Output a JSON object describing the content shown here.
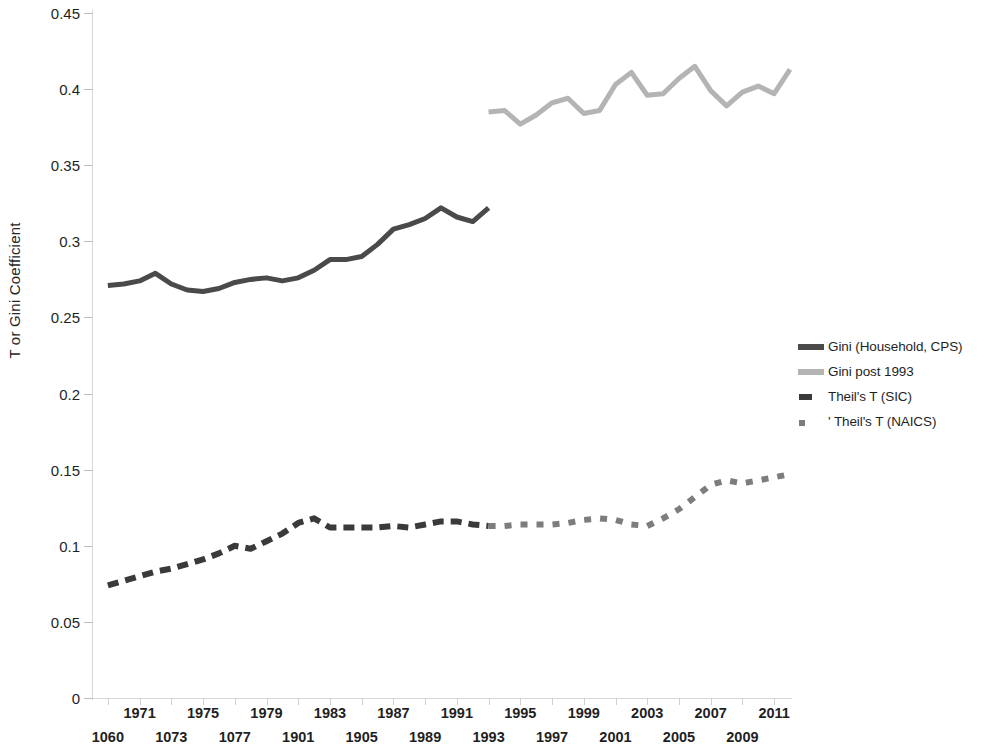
{
  "chart_data": {
    "type": "line",
    "title": "",
    "xlabel": "",
    "ylabel": "T or Gini Coefficient",
    "ylim": [
      0,
      0.45
    ],
    "ytick_labels": [
      "0.45",
      "0.4",
      "0.35",
      "0.3",
      "0.25",
      "0.2",
      "0.15",
      "0.1",
      "0.05",
      "0"
    ],
    "ytick_values": [
      0.45,
      0.4,
      0.35,
      0.3,
      0.25,
      0.2,
      0.15,
      0.1,
      0.05,
      0
    ],
    "xlim": [
      1968,
      2012
    ],
    "grid": false,
    "legend_position": "right",
    "xtick_labels_top": [
      "1971",
      "1975",
      "1979",
      "1983",
      "1987",
      "1991",
      "1995",
      "1999",
      "2003",
      "2007",
      "2011"
    ],
    "xtick_labels_bottom": [
      "1060",
      "1073",
      "1077",
      "1901",
      "1905",
      "1989",
      "1993",
      "1997",
      "2001",
      "2005",
      "2009"
    ],
    "xtick_values_top": [
      1971,
      1975,
      1979,
      1983,
      1987,
      1991,
      1995,
      1999,
      2003,
      2007,
      2011
    ],
    "xtick_values_bottom": [
      1969,
      1973,
      1977,
      1981,
      1985,
      1989,
      1993,
      1997,
      2001,
      2005,
      2009
    ],
    "series": [
      {
        "name": "Gini (Household, CPS)",
        "color": "#4a4a4a",
        "style": "solid",
        "width": 5,
        "x": [
          1969,
          1970,
          1971,
          1972,
          1973,
          1974,
          1975,
          1976,
          1977,
          1978,
          1979,
          1980,
          1981,
          1982,
          1983,
          1984,
          1985,
          1986,
          1987,
          1988,
          1989,
          1990,
          1991,
          1992,
          1993
        ],
        "values": [
          0.271,
          0.272,
          0.274,
          0.279,
          0.272,
          0.268,
          0.267,
          0.269,
          0.273,
          0.275,
          0.276,
          0.274,
          0.276,
          0.281,
          0.288,
          0.288,
          0.29,
          0.298,
          0.308,
          0.311,
          0.315,
          0.322,
          0.316,
          0.313,
          0.322
        ]
      },
      {
        "name": "Gini post 1993",
        "color": "#b4b4b4",
        "style": "solid",
        "width": 5,
        "x": [
          1993,
          1994,
          1995,
          1996,
          1997,
          1998,
          1999,
          2000,
          2001,
          2002,
          2003,
          2004,
          2005,
          2006,
          2007,
          2008,
          2009,
          2010,
          2011,
          2012
        ],
        "values": [
          0.385,
          0.386,
          0.377,
          0.383,
          0.391,
          0.394,
          0.384,
          0.386,
          0.403,
          0.411,
          0.396,
          0.397,
          0.407,
          0.415,
          0.399,
          0.389,
          0.398,
          0.402,
          0.397,
          0.413
        ]
      },
      {
        "name": "Theil's T (SIC)",
        "color": "#3a3a3a",
        "style": "dashed",
        "width": 6,
        "x": [
          1969,
          1970,
          1971,
          1972,
          1973,
          1974,
          1975,
          1976,
          1977,
          1978,
          1979,
          1980,
          1981,
          1982,
          1983,
          1984,
          1985,
          1986,
          1987,
          1988,
          1989,
          1990,
          1991,
          1992,
          1993
        ],
        "values": [
          0.074,
          0.077,
          0.08,
          0.083,
          0.085,
          0.088,
          0.091,
          0.095,
          0.1,
          0.098,
          0.103,
          0.108,
          0.115,
          0.118,
          0.112,
          0.112,
          0.112,
          0.112,
          0.113,
          0.112,
          0.114,
          0.116,
          0.116,
          0.114,
          0.113
        ]
      },
      {
        "name": "' Theil's T (NAICS)",
        "color": "#7d7d7d",
        "style": "dotted",
        "width": 6,
        "x": [
          1993,
          1994,
          1995,
          1996,
          1997,
          1998,
          1999,
          2000,
          2001,
          2002,
          2003,
          2004,
          2005,
          2006,
          2007,
          2008,
          2009,
          2010,
          2011,
          2012
        ],
        "values": [
          0.113,
          0.113,
          0.114,
          0.114,
          0.114,
          0.115,
          0.117,
          0.118,
          0.117,
          0.114,
          0.113,
          0.118,
          0.124,
          0.132,
          0.14,
          0.143,
          0.141,
          0.143,
          0.145,
          0.147
        ]
      }
    ],
    "legend": [
      {
        "label": "Gini (Household, CPS)",
        "swatch": "solid-dark",
        "color": "#4a4a4a"
      },
      {
        "label": "Gini post 1993",
        "swatch": "solid-light",
        "color": "#b4b4b4"
      },
      {
        "label": "Theil's T (SIC)",
        "swatch": "dash-dark",
        "color": "#3a3a3a"
      },
      {
        "label": "' Theil's T (NAICS)",
        "swatch": "dot-mid",
        "color": "#7d7d7d"
      }
    ]
  }
}
